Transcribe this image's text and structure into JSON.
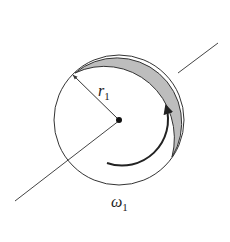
{
  "diagram": {
    "radius_label": {
      "symbol": "r",
      "subscript": "1"
    },
    "angular_velocity_label": {
      "symbol": "ω",
      "subscript": "1"
    },
    "colors": {
      "stroke": "#333333",
      "rim_shade": "#bdbdbd",
      "background": "#ffffff"
    }
  }
}
